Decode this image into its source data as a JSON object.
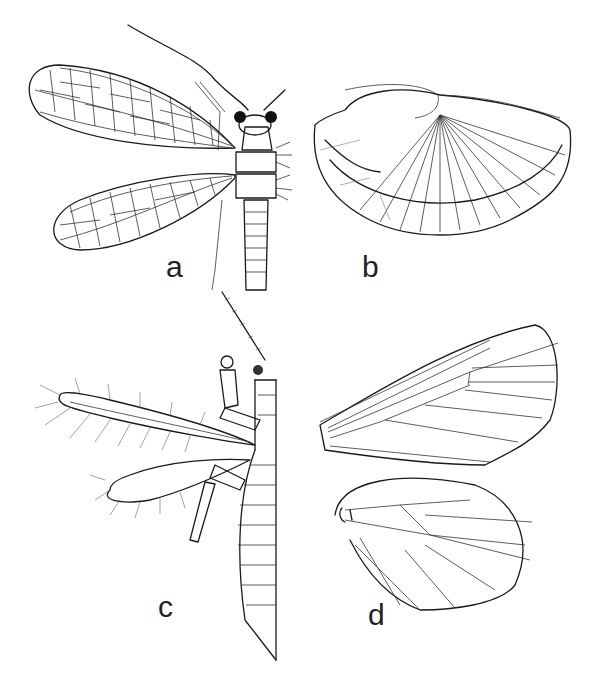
{
  "figure": {
    "panels": [
      {
        "id": "a",
        "label": "a",
        "subject": "neuropteran-like insect, dorsal view, reticulate wings"
      },
      {
        "id": "b",
        "label": "b",
        "subject": "fan-folded hind wing with radiating veins"
      },
      {
        "id": "c",
        "label": "c",
        "subject": "insect with narrow fringed wings, dorsal half view"
      },
      {
        "id": "d",
        "label": "d",
        "subject": "fore and hind wing venation, lepidopteran-like"
      }
    ]
  }
}
